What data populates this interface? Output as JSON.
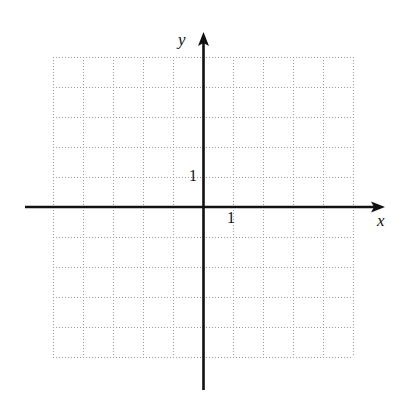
{
  "figure": {
    "kind": "coordinate-grid",
    "background_color": "#ffffff",
    "axis_color": "#111111",
    "grid_color": "#9a9a9a",
    "width": 401,
    "height": 399
  },
  "axes": {
    "x_label": "x",
    "y_label": "y",
    "x_tick_label": "1",
    "y_tick_label": "1"
  },
  "chart_data": {
    "type": "scatter",
    "title": "",
    "subtitle": "",
    "xlabel": "x",
    "ylabel": "y",
    "series": [
      {
        "name": "empty-grid",
        "x": [],
        "y": []
      }
    ],
    "x": [],
    "values": [],
    "annotations": [
      {
        "text": "1",
        "axis": "x",
        "value": 1
      },
      {
        "text": "1",
        "axis": "y",
        "value": 1
      }
    ],
    "xlim": [
      -5,
      5
    ],
    "ylim": [
      -5,
      5
    ],
    "x_ticks": [
      -5,
      -4,
      -3,
      -2,
      -1,
      0,
      1,
      2,
      3,
      4,
      5
    ],
    "y_ticks": [
      -5,
      -4,
      -3,
      -2,
      -1,
      0,
      1,
      2,
      3,
      4,
      5
    ],
    "x_tick_labels": [
      "",
      "",
      "",
      "",
      "",
      "",
      "1",
      "",
      "",
      "",
      ""
    ],
    "y_tick_labels": [
      "",
      "",
      "",
      "",
      "",
      "",
      "1",
      "",
      "",
      "",
      ""
    ],
    "grid": true,
    "grid_style": "dotted",
    "legend": false,
    "legend_position": "none",
    "unit_pixels": 30,
    "origin_pixels": {
      "x": 203,
      "y": 207
    },
    "grid_extent_pixels": {
      "left": 53,
      "right": 353,
      "top": 57,
      "bottom": 357
    }
  }
}
